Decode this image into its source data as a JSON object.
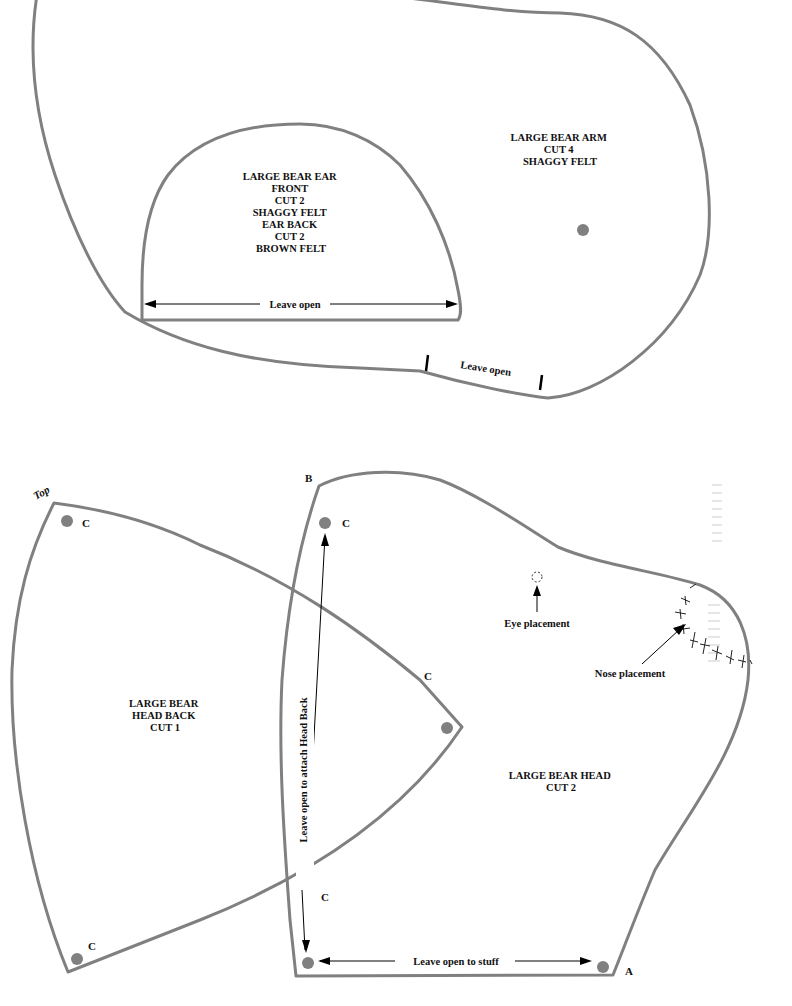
{
  "colors": {
    "outline": "#808080",
    "dot": "#808080",
    "text": "#111111",
    "background": "#ffffff"
  },
  "pieces": {
    "arm": {
      "label_lines": [
        "LARGE BEAR ARM",
        "CUT 4",
        "SHAGGY FELT"
      ],
      "opening_label": "Leave open"
    },
    "ear": {
      "label_lines": [
        "LARGE BEAR EAR",
        "FRONT",
        "CUT 2",
        "SHAGGY FELT",
        "EAR BACK",
        "CUT 2",
        "BROWN FELT"
      ],
      "opening_label": "Leave open"
    },
    "head_back": {
      "label_lines": [
        "LARGE BEAR",
        "HEAD BACK",
        "CUT 1"
      ],
      "top_label": "Top",
      "markers": [
        "C",
        "C",
        "C"
      ]
    },
    "head": {
      "label_lines": [
        "LARGE BEAR HEAD",
        "CUT 2"
      ],
      "corner_b": "B",
      "corner_a": "A",
      "markers": [
        "C",
        "C"
      ],
      "side_opening_label": "Leave open to attach Head Back",
      "bottom_opening_label": "Leave open to stuff",
      "eye_label": "Eye placement",
      "nose_label": "Nose placement"
    }
  }
}
